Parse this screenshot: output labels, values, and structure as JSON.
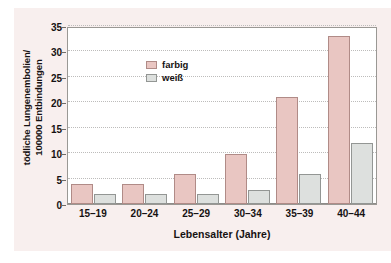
{
  "chart_data": {
    "type": "bar",
    "title": "",
    "xlabel": "Lebensalter (Jahre)",
    "ylabel_line1": "tödliche Lungenembolien/",
    "ylabel_line2": "100000 Entbindungen",
    "categories": [
      "15–19",
      "20–24",
      "25–29",
      "30–34",
      "35–39",
      "40–44"
    ],
    "series": [
      {
        "name": "farbig",
        "color": "#e9c6c2",
        "values": [
          4,
          4,
          6,
          9.8,
          21,
          33
        ]
      },
      {
        "name": "weiß",
        "color": "#dde0de",
        "values": [
          2,
          2,
          2,
          2.8,
          6,
          12
        ]
      }
    ],
    "ylim": [
      0,
      35
    ],
    "yticks": [
      0,
      5,
      10,
      15,
      20,
      25,
      30,
      35
    ],
    "ytick_labels": [
      "0",
      "5",
      "10",
      "15",
      "20",
      "25",
      "30",
      "35"
    ],
    "grid": "horizontal-dotted",
    "legend_position": "top-left-inside"
  }
}
